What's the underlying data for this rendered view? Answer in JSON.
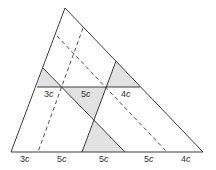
{
  "figure": {
    "type": "triangle-partition-diagram",
    "colors": {
      "stroke": "#3a3a3a",
      "shade": "#e2e2e2",
      "background": "#ffffff"
    },
    "inner_labels": [
      {
        "num": "3",
        "var": "c",
        "x": 44,
        "y": 89
      },
      {
        "num": "5",
        "var": "c",
        "x": 81,
        "y": 89
      },
      {
        "num": "4",
        "var": "c",
        "x": 121,
        "y": 89
      }
    ],
    "base_labels": [
      {
        "num": "3",
        "var": "c",
        "x": 20,
        "y": 154
      },
      {
        "num": "5",
        "var": "c",
        "x": 57,
        "y": 154
      },
      {
        "num": "5",
        "var": "c",
        "x": 99,
        "y": 154
      },
      {
        "num": "5",
        "var": "c",
        "x": 144,
        "y": 154
      },
      {
        "num": "4",
        "var": "c",
        "x": 181,
        "y": 154
      }
    ]
  }
}
